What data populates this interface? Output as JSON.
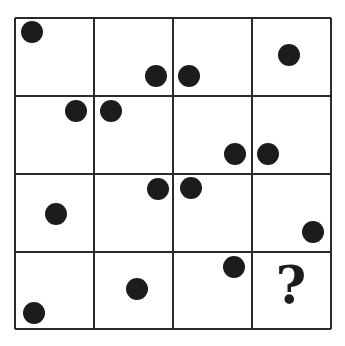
{
  "puzzle": {
    "type": "4x4 dot-position grid sequence",
    "rows": 4,
    "cols": 4,
    "grid": {
      "left": 15,
      "top": 18,
      "right": 331,
      "bottom": 329,
      "v_lines": [
        15,
        94,
        173,
        252,
        331
      ],
      "h_lines": [
        18,
        96,
        174,
        252,
        329
      ]
    },
    "line_color": "#2a2a2a",
    "dot_color": "#1c1c1c",
    "dot_radius": 11,
    "dots": [
      {
        "cell": "r1c1",
        "x": 32,
        "y": 32
      },
      {
        "cell": "r1c2",
        "x": 156,
        "y": 76
      },
      {
        "cell": "r1c3",
        "x": 189,
        "y": 76
      },
      {
        "cell": "r1c4",
        "x": 289,
        "y": 55
      },
      {
        "cell": "r2c1",
        "x": 76,
        "y": 111
      },
      {
        "cell": "r2c2",
        "x": 111,
        "y": 111
      },
      {
        "cell": "r2c3",
        "x": 235,
        "y": 154
      },
      {
        "cell": "r2c4",
        "x": 268,
        "y": 154
      },
      {
        "cell": "r3c1",
        "x": 56,
        "y": 214
      },
      {
        "cell": "r3c2",
        "x": 158,
        "y": 189
      },
      {
        "cell": "r3c3",
        "x": 191,
        "y": 188
      },
      {
        "cell": "r3c4",
        "x": 313,
        "y": 232
      },
      {
        "cell": "r4c1",
        "x": 34,
        "y": 313
      },
      {
        "cell": "r4c2",
        "x": 137,
        "y": 289
      },
      {
        "cell": "r4c3",
        "x": 234,
        "y": 267
      }
    ],
    "question_mark": {
      "text": "?",
      "cell": "r4c4",
      "x": 291,
      "y": 303
    }
  }
}
